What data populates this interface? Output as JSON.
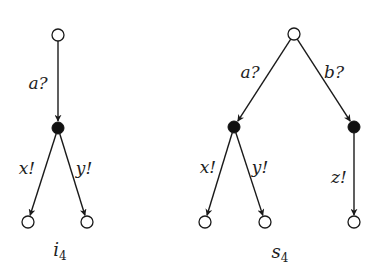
{
  "diagram": {
    "type": "labelled transition trees",
    "trees": [
      {
        "id": "i4",
        "name": "i",
        "subscript": "4",
        "nodes": [
          {
            "id": "i4_root",
            "kind": "open"
          },
          {
            "id": "i4_mid",
            "kind": "filled"
          },
          {
            "id": "i4_leaf1",
            "kind": "open"
          },
          {
            "id": "i4_leaf2",
            "kind": "open"
          }
        ],
        "edges": [
          {
            "from": "i4_root",
            "to": "i4_mid",
            "label": "a?"
          },
          {
            "from": "i4_mid",
            "to": "i4_leaf1",
            "label": "x!"
          },
          {
            "from": "i4_mid",
            "to": "i4_leaf2",
            "label": "y!"
          }
        ]
      },
      {
        "id": "s4",
        "name": "s",
        "subscript": "4",
        "nodes": [
          {
            "id": "s4_root",
            "kind": "open"
          },
          {
            "id": "s4_midA",
            "kind": "filled"
          },
          {
            "id": "s4_midB",
            "kind": "filled"
          },
          {
            "id": "s4_leaf1",
            "kind": "open"
          },
          {
            "id": "s4_leaf2",
            "kind": "open"
          },
          {
            "id": "s4_leaf3",
            "kind": "open"
          }
        ],
        "edges": [
          {
            "from": "s4_root",
            "to": "s4_midA",
            "label": "a?"
          },
          {
            "from": "s4_root",
            "to": "s4_midB",
            "label": "b?"
          },
          {
            "from": "s4_midA",
            "to": "s4_leaf1",
            "label": "x!"
          },
          {
            "from": "s4_midA",
            "to": "s4_leaf2",
            "label": "y!"
          },
          {
            "from": "s4_midB",
            "to": "s4_leaf3",
            "label": "z!"
          }
        ]
      }
    ]
  }
}
